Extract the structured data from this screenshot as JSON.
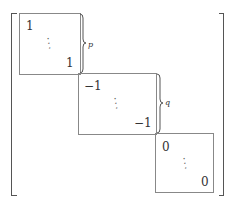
{
  "matrix": {
    "blocks": [
      {
        "top_left": "1",
        "bottom_right": "1",
        "dots": "⋱",
        "brace_label": "p"
      },
      {
        "top_left": "−1",
        "bottom_right": "−1",
        "dots": "⋱",
        "brace_label": "q"
      },
      {
        "top_left": "0",
        "bottom_right": "0",
        "dots": "⋱"
      }
    ]
  }
}
